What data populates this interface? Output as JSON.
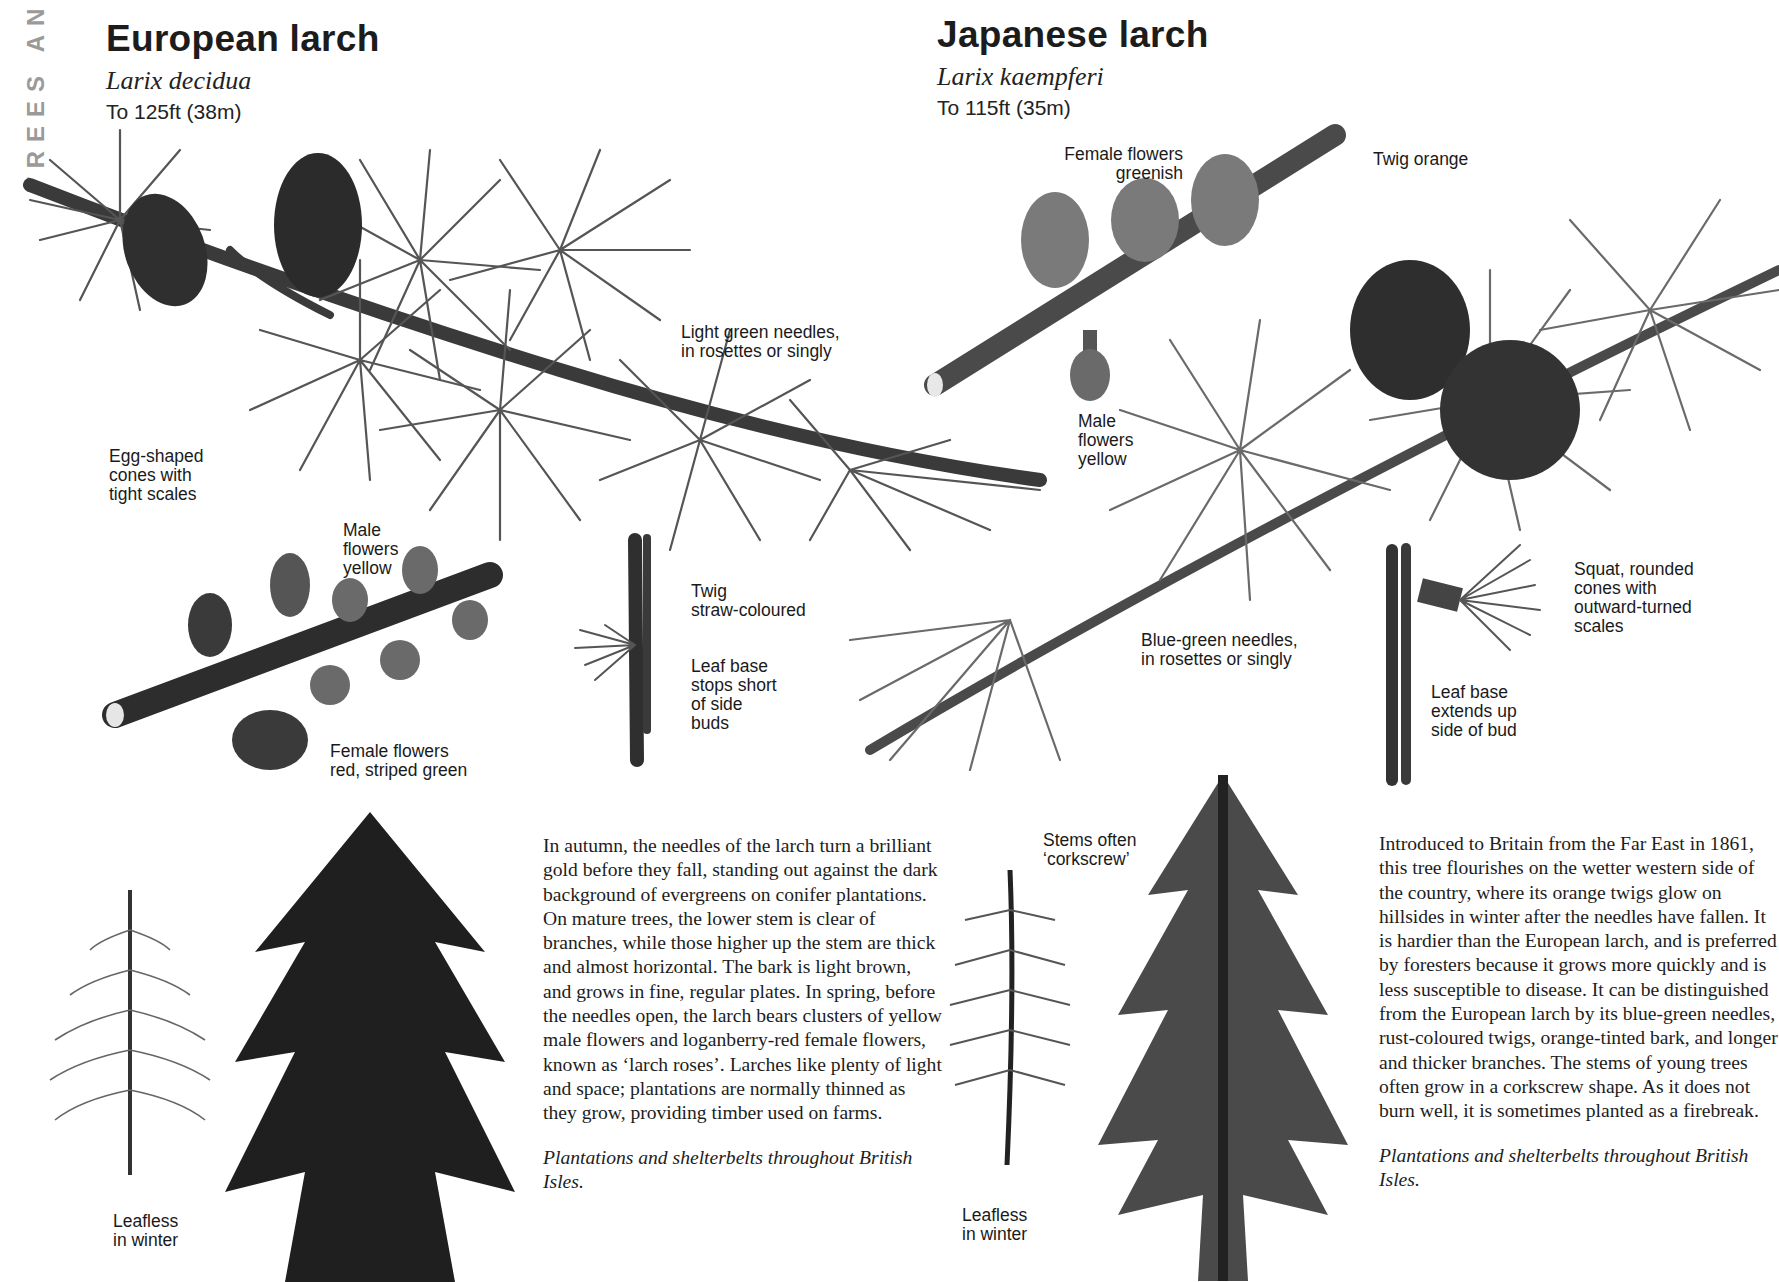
{
  "page": {
    "section_tab": "TREES AND"
  },
  "european": {
    "title": "European larch",
    "latin": "Larix decidua",
    "height": "To 125ft (38m)",
    "labels": {
      "cones": "Egg-shaped\ncones with\ntight scales",
      "needles": "Light green needles,\nin rosettes or singly",
      "male_flowers": "Male\nflowers\nyellow",
      "female_flowers": "Female flowers\nred, striped green",
      "twig": "Twig\nstraw-coloured",
      "leaf_base": "Leaf base\nstops short\nof side\nbuds",
      "leafless": "Leafless\nin winter"
    },
    "description": "In autumn, the needles of the larch turn a brilliant gold before they fall, standing out against the dark background of evergreens on conifer plantations. On mature trees, the lower stem is clear of branches, while those higher up the stem are thick and almost horizontal. The bark is light brown, and grows in fine, regular plates. In spring, before the needles open, the larch bears clusters of yellow male flowers and loganberry-red female flowers, known as ‘larch roses’. Larches like plenty of light and space; plantations are normally thinned as they grow, providing timber used on farms.",
    "distribution": "Plantations and shelterbelts throughout British Isles."
  },
  "japanese": {
    "title": "Japanese larch",
    "latin": "Larix kaempferi",
    "height": "To 115ft (35m)",
    "labels": {
      "female_flowers": "Female flowers\ngreenish",
      "twig": "Twig orange",
      "male_flowers": "Male\nflowers\nyellow",
      "needles": "Blue-green needles,\nin rosettes or singly",
      "cones": "Squat, rounded\ncones with\noutward-turned\nscales",
      "leaf_base": "Leaf base\nextends up\nside of bud",
      "stems": "Stems often\n‘corkscrew’",
      "leafless": "Leafless\nin winter"
    },
    "description": "Introduced to Britain from the Far East in 1861, this tree flourishes on the wetter western side of the country, where its orange twigs glow on hillsides in winter after the needles have fallen. It is hardier than the European larch, and is preferred by foresters because it grows more quickly and is less susceptible to disease. It can be distinguished from the European larch by its blue-green needles, rust-coloured twigs, orange-tinted bark, and longer and thicker branches. The stems of young trees often grow in a corkscrew shape. As it does not burn well, it is sometimes planted as a firebreak.",
    "distribution": "Plantations and shelterbelts throughout British Isles."
  }
}
